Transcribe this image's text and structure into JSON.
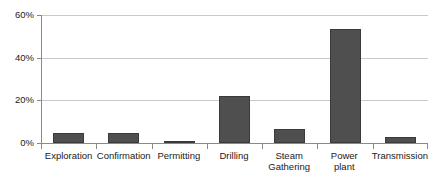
{
  "chart_data": {
    "type": "bar",
    "title": "",
    "subtitle": "",
    "xlabel": "",
    "ylabel": "",
    "categories": [
      "Exploration",
      "Confirmation",
      "Permitting",
      "Drilling",
      "Steam\nGathering",
      "Power\nplant",
      "Transmission"
    ],
    "values": [
      4.5,
      4.5,
      1.0,
      22.0,
      6.5,
      53.5,
      3.0
    ],
    "value_suffix": "%",
    "ylim": [
      0,
      60
    ],
    "ytick_values": [
      0,
      20,
      40,
      60
    ],
    "ytick_labels": [
      "0%",
      "20%",
      "40%",
      "60%"
    ],
    "grid": true,
    "grid_axis": "y",
    "legend": false,
    "legend_position": "none",
    "series": [
      {
        "name": "Share of cost",
        "values": [
          4.5,
          4.5,
          1.0,
          22.0,
          6.5,
          53.5,
          3.0
        ]
      }
    ],
    "colors": {
      "bar_fill": "#4f4f4f",
      "bar_border": "#3a3a3a",
      "gridline": "#c9c9c9",
      "axis": "#8a8a8a",
      "text": "#1a1a1a",
      "background": "#ffffff"
    }
  }
}
